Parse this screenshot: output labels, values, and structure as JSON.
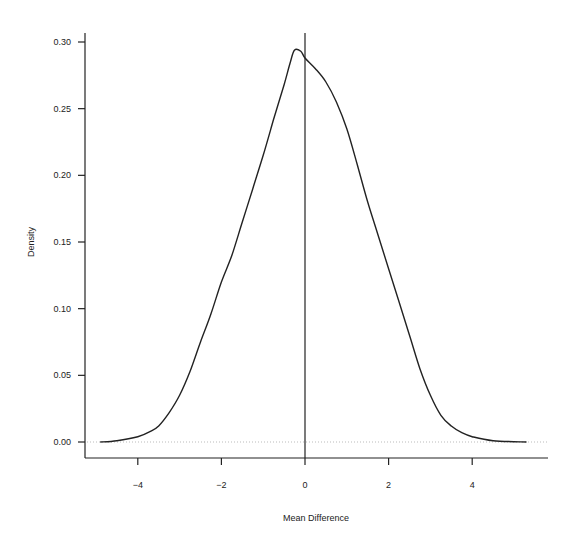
{
  "chart_data": {
    "type": "line",
    "title": "",
    "xlabel": "Mean Difference",
    "ylabel": "Density",
    "xlim": [
      -5.3,
      5.8
    ],
    "ylim": [
      -0.008,
      0.305
    ],
    "x_ticks": [
      -4,
      -2,
      0,
      2,
      4
    ],
    "x_tick_labels": [
      "-4",
      "-2",
      "0",
      "2",
      "4"
    ],
    "y_ticks": [
      0.0,
      0.05,
      0.1,
      0.15,
      0.2,
      0.25,
      0.3
    ],
    "y_tick_labels": [
      "0.00",
      "0.05",
      "0.10",
      "0.15",
      "0.20",
      "0.25",
      "0.30"
    ],
    "grid": false,
    "legend": null,
    "reference_lines": [
      {
        "orientation": "vertical",
        "x": 0,
        "style": "solid"
      },
      {
        "orientation": "horizontal",
        "y": 0,
        "style": "dotted"
      }
    ],
    "series": [
      {
        "name": "density",
        "x": [
          -4.9,
          -4.5,
          -4.0,
          -3.7,
          -3.5,
          -3.25,
          -3.0,
          -2.75,
          -2.5,
          -2.25,
          -2.0,
          -1.75,
          -1.5,
          -1.25,
          -1.0,
          -0.75,
          -0.5,
          -0.35,
          -0.25,
          -0.1,
          0.0,
          0.25,
          0.5,
          0.75,
          1.0,
          1.25,
          1.5,
          1.75,
          2.0,
          2.25,
          2.5,
          2.75,
          3.0,
          3.25,
          3.5,
          3.75,
          4.0,
          4.5,
          5.3
        ],
        "values": [
          0.0,
          0.001,
          0.004,
          0.008,
          0.012,
          0.022,
          0.035,
          0.053,
          0.075,
          0.096,
          0.12,
          0.14,
          0.165,
          0.19,
          0.215,
          0.242,
          0.268,
          0.285,
          0.294,
          0.293,
          0.288,
          0.28,
          0.27,
          0.255,
          0.235,
          0.208,
          0.18,
          0.155,
          0.13,
          0.105,
          0.08,
          0.055,
          0.035,
          0.02,
          0.012,
          0.007,
          0.004,
          0.001,
          0.0
        ]
      }
    ]
  },
  "colors": {
    "line": "#222222",
    "axis": "#222222",
    "zero_line": "#bbbbbb",
    "background": "#ffffff"
  }
}
